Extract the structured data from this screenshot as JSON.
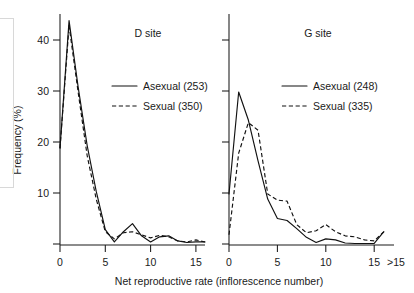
{
  "figure": {
    "background_color": "#ffffff",
    "ink_color": "#111111",
    "xlabel": "Net reproductive rate (inflorescence number)",
    "ylabel": "Frequency (%)"
  },
  "chart_data": {
    "type": "line",
    "title": "",
    "xlabel": "Net reproductive rate (inflorescence number)",
    "ylabel": "Frequency (%)",
    "xlim": [
      0,
      16
    ],
    "ylim": [
      0,
      45
    ],
    "grid": false,
    "legend_position": "inside-upper-right",
    "x_tick_labels": [
      "0",
      "5",
      "10",
      "15",
      ">15"
    ],
    "x_tick_values": [
      0,
      5,
      10,
      15,
      16
    ],
    "y_tick_labels": [
      "10",
      "20",
      "30",
      "40"
    ],
    "y_tick_values": [
      10,
      20,
      30,
      40
    ],
    "panels": [
      {
        "name": "D site",
        "title": "D site",
        "y_axis_labeled": true,
        "x": [
          0,
          1,
          2,
          3,
          4,
          5,
          6,
          7,
          8,
          9,
          10,
          11,
          12,
          13,
          14,
          15,
          16
        ],
        "series": [
          {
            "name": "Asexual (253)",
            "label": "Asexual (253)",
            "style": "solid",
            "n": 253,
            "values": [
              19.0,
              44.0,
              31.0,
              19.5,
              10.5,
              3.0,
              0.6,
              2.6,
              4.2,
              1.8,
              0.6,
              1.6,
              1.8,
              0.8,
              0.5,
              0.6,
              0.6
            ]
          },
          {
            "name": "Sexual (350)",
            "label": "Sexual (350)",
            "style": "dashed",
            "n": 350,
            "values": [
              19.0,
              43.0,
              30.0,
              17.5,
              9.0,
              2.6,
              1.2,
              2.4,
              2.6,
              2.0,
              1.4,
              1.9,
              1.6,
              0.8,
              0.6,
              1.0,
              0.6
            ]
          }
        ]
      },
      {
        "name": "G site",
        "title": "G site",
        "y_axis_labeled": false,
        "x": [
          0,
          1,
          2,
          3,
          4,
          5,
          6,
          7,
          8,
          9,
          10,
          11,
          12,
          13,
          14,
          15,
          16
        ],
        "series": [
          {
            "name": "Asexual (248)",
            "label": "Asexual (248)",
            "style": "solid",
            "n": 248,
            "values": [
              10.0,
              30.0,
              24.5,
              16.5,
              9.0,
              5.2,
              4.8,
              3.2,
              1.5,
              0.5,
              1.2,
              1.0,
              0.4,
              0.3,
              0.3,
              0.3,
              2.6
            ]
          },
          {
            "name": "Sexual (335)",
            "label": "Sexual (335)",
            "style": "dashed",
            "n": 335,
            "values": [
              2.0,
              18.0,
              24.0,
              22.5,
              10.0,
              8.8,
              8.6,
              4.0,
              2.4,
              2.8,
              4.0,
              2.6,
              1.8,
              1.6,
              1.0,
              0.8,
              2.6
            ]
          }
        ]
      }
    ]
  }
}
